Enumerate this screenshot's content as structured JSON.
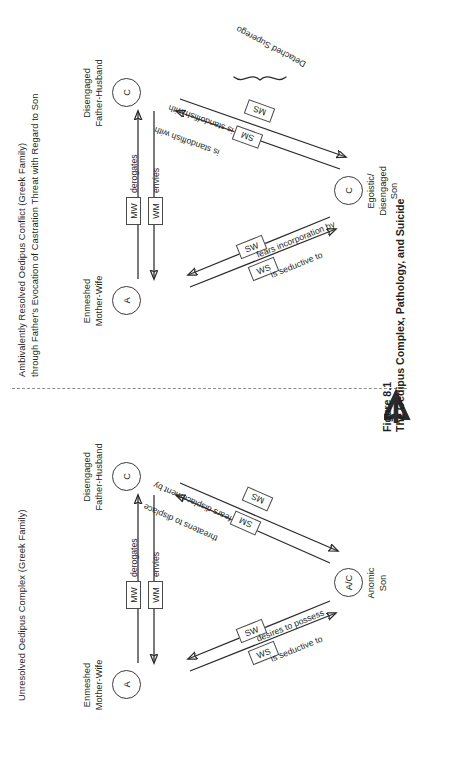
{
  "figure": {
    "number": "Figure 8.1",
    "caption": "The Oedipus Complex, Pathology, and Suicide"
  },
  "panels": [
    {
      "id": "panel-1",
      "title_line_1": "Unresolved Oedipus Complex (Greek Family)",
      "title_line_2": "",
      "nodes": {
        "father": {
          "code": "C",
          "label_line_1": "Disengaged",
          "label_line_2": "Father-Husband"
        },
        "mother": {
          "code": "A",
          "label_line_1": "Enmeshed",
          "label_line_2": "Mother-Wife"
        },
        "son": {
          "code": "A/C",
          "label_line_1": "Anomic",
          "label_line_2": "Son"
        }
      },
      "relations": {
        "mother_father_top": {
          "box": "MW",
          "label": "derogates"
        },
        "mother_father_bot": {
          "box": "WM",
          "label": "envies"
        },
        "son_father_out": {
          "box": "SM",
          "label": "threatens to displace"
        },
        "son_father_in": {
          "box": "MS",
          "label": "fears displacement by"
        },
        "son_mother_out": {
          "box": "SW",
          "label": "desires to possess"
        },
        "son_mother_in": {
          "box": "WS",
          "label": "is seductive to"
        }
      },
      "annotation": ""
    },
    {
      "id": "panel-2",
      "title_line_1": "Ambivalently Resolved Oedipus Conflict (Greek Family)",
      "title_line_2": "through Father's Evocation of Castration Threat with Regard to Son",
      "nodes": {
        "father": {
          "code": "C",
          "label_line_1": "Disengaged",
          "label_line_2": "Father-Husband"
        },
        "mother": {
          "code": "A",
          "label_line_1": "Enmeshed",
          "label_line_2": "Mother-Wife"
        },
        "son": {
          "code": "C",
          "label_line_1": "Egoistic/",
          "label_line_2": "Disengaged",
          "label_line_3": "Son"
        }
      },
      "relations": {
        "mother_father_top": {
          "box": "MW",
          "label": "derogates"
        },
        "mother_father_bot": {
          "box": "WM",
          "label": "envies"
        },
        "son_father_out": {
          "box": "SM",
          "label": "is standoffish with"
        },
        "son_father_in": {
          "box": "MS",
          "label": "is standoffish with"
        },
        "son_mother_out": {
          "box": "SW",
          "label": "fears incorporation by"
        },
        "son_mother_in": {
          "box": "WS",
          "label": "is seductive to"
        }
      },
      "annotation": "Detached Superego"
    }
  ]
}
